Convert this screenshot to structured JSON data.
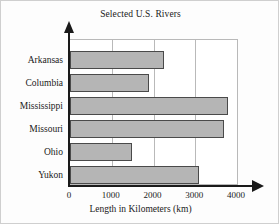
{
  "chart_data": {
    "type": "bar",
    "orientation": "horizontal",
    "title": "Selected U.S. Rivers",
    "xlabel": "Length in Kilometers (km)",
    "ylabel": "",
    "categories": [
      "Arkansas",
      "Columbia",
      "Mississippi",
      "Missouri",
      "Ohio",
      "Yukon"
    ],
    "values": [
      2250,
      1900,
      3780,
      3700,
      1490,
      3080
    ],
    "xlim": [
      0,
      4000
    ],
    "xticks": [
      0,
      1000,
      2000,
      3000,
      4000
    ],
    "xtick_labels": [
      "0",
      "1000",
      "2000",
      "3000",
      "4000"
    ],
    "gridlines": [
      1000,
      2000,
      3000
    ],
    "grid": true,
    "legend": null,
    "bar_fill_color": "#b5b5b5",
    "bar_border_color": "#4a4a4a",
    "axis_color": "#1a1a1a",
    "grid_color": "#b9b9b9",
    "background_color": "#fdfdfd"
  },
  "axes": {
    "y_axis_name": "river-category-axis",
    "x_axis_name": "length-value-axis"
  }
}
